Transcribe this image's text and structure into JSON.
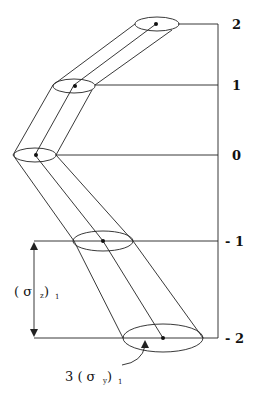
{
  "diagram": {
    "type": "puff-plume dispersion schematic",
    "levels": [
      {
        "label": "2",
        "y": 24,
        "cx": 156,
        "rx": 22,
        "ry": 7
      },
      {
        "label": "1",
        "y": 85,
        "cx": 74,
        "rx": 21,
        "ry": 7
      },
      {
        "label": "0",
        "y": 155,
        "cx": 35,
        "rx": 21,
        "ry": 7
      },
      {
        "label": "- 1",
        "y": 241,
        "cx": 103,
        "rx": 30,
        "ry": 10
      },
      {
        "label": "- 2",
        "y": 338,
        "cx": 163,
        "rx": 40,
        "ry": 14
      }
    ],
    "annotations": {
      "vertical_spread": {
        "main": "( σ",
        "sub1": "z",
        "close": " )",
        "sub2": "1"
      },
      "horizontal_spread": {
        "prefix": "3 ( σ",
        "sub1": "y",
        "close": " )",
        "sub2": "1"
      }
    },
    "colors": {
      "line": "#222222",
      "background": "#ffffff"
    }
  }
}
